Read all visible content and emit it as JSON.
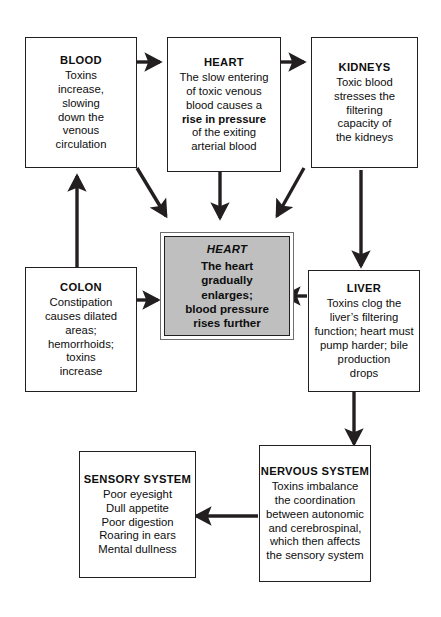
{
  "diagram": {
    "background_color": "#ffffff",
    "line_color": "#231f20",
    "highlight_fill": "#bfbfbf",
    "nodes": [
      {
        "id": "blood",
        "title": "BLOOD",
        "body": "Toxins\nincrease,\nslowing\ndown the\nvenous\ncirculation"
      },
      {
        "id": "heart_top",
        "title": "HEART",
        "body_pre": "The slow entering\nof toxic venous\nblood causes a\n",
        "body_bold": "rise in pressure",
        "body_post": "\nof the exiting\narterial blood"
      },
      {
        "id": "kidneys",
        "title": "KIDNEYS",
        "body": "Toxic blood\nstresses the\nfiltering\ncapacity of\nthe kidneys"
      },
      {
        "id": "heart_center",
        "title": "HEART",
        "body": "The heart\ngradually\nenlarges;\nblood pressure\nrises further"
      },
      {
        "id": "colon",
        "title": "COLON",
        "body": "Constipation\ncauses dilated\nareas;\nhemorrhoids;\ntoxins\nincrease"
      },
      {
        "id": "liver",
        "title": "LIVER",
        "body": "Toxins clog the\nliver’s filtering\nfunction; heart must\npump harder; bile\nproduction\ndrops"
      },
      {
        "id": "nervous",
        "title": "NERVOUS SYSTEM",
        "body": "Toxins imbalance\nthe coordination\nbetween autonomic\nand cerebrospinal,\nwhich then affects\nthe sensory system"
      },
      {
        "id": "sensory",
        "title": "SENSORY SYSTEM",
        "body": "Poor eyesight\nDull appetite\nPoor digestion\nRoaring in ears\nMental dullness"
      }
    ],
    "edges": [
      {
        "id": "blood-to-heart-top",
        "from": "blood",
        "to": "heart_top"
      },
      {
        "id": "heart-top-to-kidneys",
        "from": "heart_top",
        "to": "kidneys"
      },
      {
        "id": "blood-to-heart-center",
        "from": "blood",
        "to": "heart_center"
      },
      {
        "id": "heart-top-to-heart-center",
        "from": "heart_top",
        "to": "heart_center"
      },
      {
        "id": "kidneys-to-heart-center",
        "from": "kidneys",
        "to": "heart_center"
      },
      {
        "id": "kidneys-to-liver",
        "from": "kidneys",
        "to": "liver"
      },
      {
        "id": "liver-to-heart-center",
        "from": "liver",
        "to": "heart_center"
      },
      {
        "id": "colon-to-heart-center",
        "from": "colon",
        "to": "heart_center"
      },
      {
        "id": "colon-to-blood",
        "from": "colon",
        "to": "blood"
      },
      {
        "id": "liver-to-nervous",
        "from": "liver",
        "to": "nervous"
      },
      {
        "id": "nervous-to-sensory",
        "from": "nervous",
        "to": "sensory"
      }
    ]
  }
}
